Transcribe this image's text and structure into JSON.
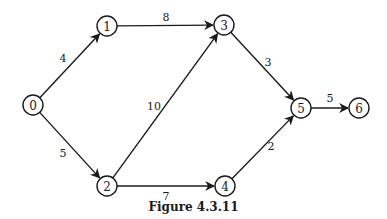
{
  "caption": "Figure 4.3.11",
  "nodes": [
    {
      "id": "0",
      "label": "0",
      "x": 33,
      "y": 105
    },
    {
      "id": "1",
      "label": "1",
      "x": 107,
      "y": 26
    },
    {
      "id": "2",
      "label": "2",
      "x": 107,
      "y": 186
    },
    {
      "id": "3",
      "label": "3",
      "x": 224,
      "y": 25
    },
    {
      "id": "4",
      "label": "4",
      "x": 225,
      "y": 186
    },
    {
      "id": "5",
      "label": "5",
      "x": 301,
      "y": 108
    },
    {
      "id": "6",
      "label": "6",
      "x": 359,
      "y": 108
    }
  ],
  "edges": [
    {
      "from": "0",
      "to": "1",
      "weight": "4",
      "lx": 63,
      "ly": 58
    },
    {
      "from": "0",
      "to": "2",
      "weight": "5",
      "lx": 63,
      "ly": 153
    },
    {
      "from": "1",
      "to": "3",
      "weight": "8",
      "lx": 166,
      "ly": 17
    },
    {
      "from": "2",
      "to": "3",
      "weight": "10",
      "lx": 154,
      "ly": 106
    },
    {
      "from": "2",
      "to": "4",
      "weight": "7",
      "lx": 166,
      "ly": 196
    },
    {
      "from": "3",
      "to": "5",
      "weight": "3",
      "lx": 268,
      "ly": 62
    },
    {
      "from": "4",
      "to": "5",
      "weight": "2",
      "lx": 271,
      "ly": 146
    },
    {
      "from": "5",
      "to": "6",
      "weight": "5",
      "lx": 330,
      "ly": 98
    }
  ]
}
